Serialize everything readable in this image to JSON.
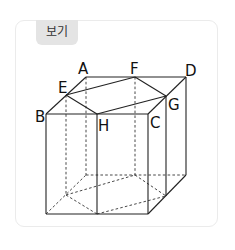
{
  "card": {
    "tag_label": "보기"
  },
  "diagram": {
    "vertex_labels": {
      "A": "A",
      "B": "B",
      "C": "C",
      "D": "D",
      "E": "E",
      "F": "F",
      "G": "G",
      "H": "H"
    }
  }
}
